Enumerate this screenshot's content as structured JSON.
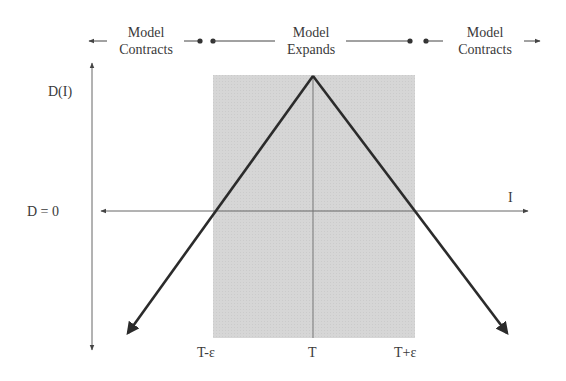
{
  "header": {
    "left": {
      "line1": "Model",
      "line2": "Contracts"
    },
    "center": {
      "line1": "Model",
      "line2": "Expands"
    },
    "right": {
      "line1": "Model",
      "line2": "Contracts"
    }
  },
  "axes": {
    "y_label": "D(I)",
    "x_label": "I",
    "zero_label": "D = 0"
  },
  "ticks": {
    "left": "T-ε",
    "center": "T",
    "right": "T+ε"
  },
  "colors": {
    "shade": "#d9d9d9",
    "line": "#2b2b2b",
    "axis": "#555555"
  }
}
